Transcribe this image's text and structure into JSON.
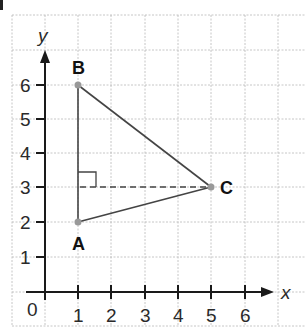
{
  "diagram": {
    "type": "coordinate-grid-triangle",
    "axes": {
      "x_label": "x",
      "y_label": "y",
      "origin_label": "0",
      "x_ticks": [
        "1",
        "2",
        "3",
        "4",
        "5",
        "6"
      ],
      "y_ticks": [
        "1",
        "2",
        "3",
        "4",
        "5",
        "6"
      ]
    },
    "points": [
      {
        "label": "A",
        "x": 1,
        "y": 2
      },
      {
        "label": "B",
        "x": 1,
        "y": 6
      },
      {
        "label": "C",
        "x": 5,
        "y": 3
      }
    ],
    "altitude": {
      "from": "C",
      "to_foot": {
        "x": 1,
        "y": 3
      },
      "style": "dashed"
    },
    "right_angle_marker": {
      "at": {
        "x": 1,
        "y": 3
      }
    },
    "colors": {
      "grid": "#b8b8b8",
      "axis": "#1a1a1a",
      "triangle": "#444444",
      "vertex": "#999999"
    }
  }
}
